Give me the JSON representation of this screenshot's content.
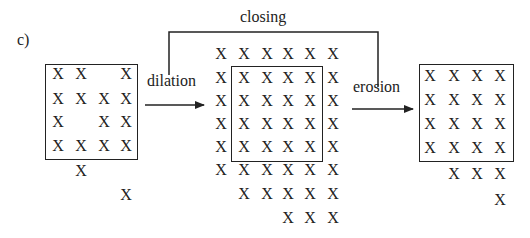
{
  "panel_label": "c)",
  "labels": {
    "closing": "closing",
    "dilation": "dilation",
    "erosion": "erosion"
  },
  "mark_glyph": "X",
  "grids": {
    "input": {
      "description": "original set",
      "rows": [
        "XX.X",
        "XXXX",
        "X.XX",
        "XXXX",
        ".X..",
        "...X"
      ]
    },
    "dilated": {
      "description": "after dilation",
      "rows": [
        "XXXXXX",
        "XXXXXX",
        "XXXXXX",
        "XXXXXX",
        "XXXXXX",
        "XXXXXX",
        ".XXXXX",
        "...XXX"
      ]
    },
    "closed": {
      "description": "after erosion (closing result)",
      "rows": [
        "XXXX",
        "XXXX",
        "XXXX",
        "XXXX",
        ".XXX",
        "...X"
      ]
    }
  }
}
